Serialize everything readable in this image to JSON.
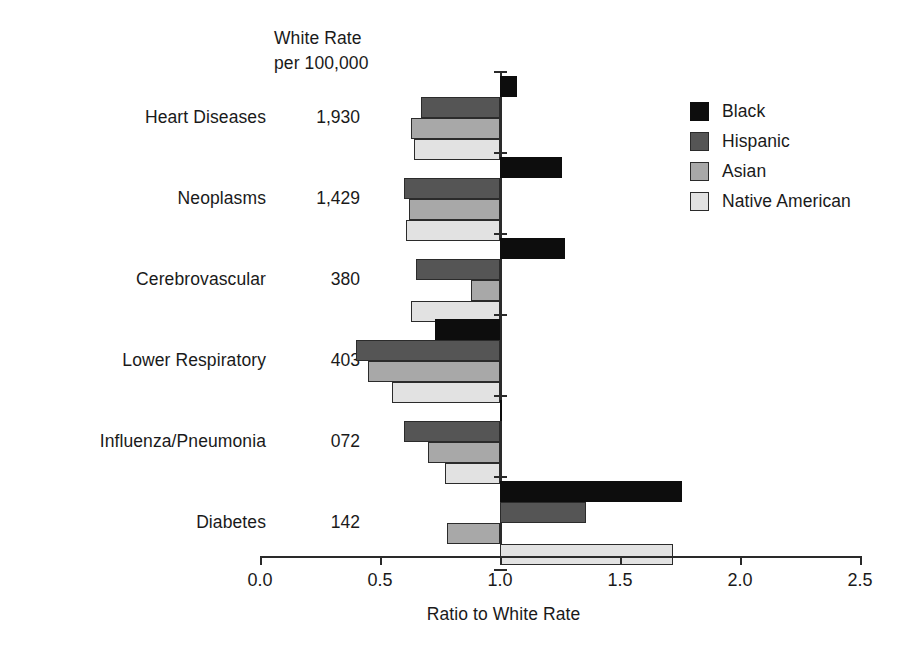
{
  "chart_data": {
    "type": "bar",
    "orientation": "horizontal-grouped-diverging",
    "title": "",
    "xlabel": "Ratio to White Rate",
    "ylabel": "",
    "xlim": [
      0.0,
      2.5
    ],
    "xticks": [
      "0.0",
      "0.5",
      "1.0",
      "1.5",
      "2.0",
      "2.5"
    ],
    "xtick_values": [
      0.0,
      0.5,
      1.0,
      1.5,
      2.0,
      2.5
    ],
    "baseline": 1.0,
    "grid": false,
    "legend_position": "top-right",
    "rate_column_header": [
      "White Rate",
      "per 100,000"
    ],
    "categories": [
      "Heart Diseases",
      "Neoplasms",
      "Cerebrovascular",
      "Lower Respiratory",
      "Influenza/Pneumonia",
      "Diabetes"
    ],
    "white_rates": [
      "1,930",
      "1,429",
      "380",
      "403",
      "072",
      "142"
    ],
    "series": [
      {
        "name": "Black",
        "color": "#0d0d0d",
        "values": [
          1.07,
          1.26,
          1.27,
          0.73,
          1.0,
          1.76
        ]
      },
      {
        "name": "Hispanic",
        "color": "#555555",
        "values": [
          0.67,
          0.6,
          0.65,
          0.4,
          0.6,
          1.36
        ]
      },
      {
        "name": "Asian",
        "color": "#a8a8a8",
        "values": [
          0.63,
          0.62,
          0.88,
          0.45,
          0.7,
          0.78
        ]
      },
      {
        "name": "Native American",
        "color": "#e2e2e2",
        "values": [
          0.64,
          0.61,
          0.63,
          0.55,
          0.77,
          1.72
        ]
      }
    ]
  }
}
